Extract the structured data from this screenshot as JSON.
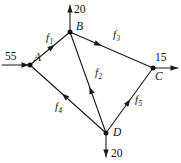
{
  "diagram": {
    "kind": "flow-network",
    "title": "",
    "colors": {
      "background": "#ffffff",
      "stroke": "#1a1a1a",
      "node_fill": "#111111",
      "text": "#111111"
    },
    "nodes": [
      {
        "id": "A",
        "label": "A",
        "x": 30,
        "y": 65,
        "label_x": 34,
        "label_y": 61
      },
      {
        "id": "B",
        "label": "B",
        "x": 70,
        "y": 32,
        "label_x": 76,
        "label_y": 30
      },
      {
        "id": "C",
        "label": "C",
        "x": 153,
        "y": 68,
        "label_x": 155,
        "label_y": 80
      },
      {
        "id": "D",
        "label": "D",
        "x": 106,
        "y": 133,
        "label_x": 113,
        "label_y": 136
      }
    ],
    "edges": [
      {
        "id": "f1",
        "label": "f",
        "subscript": "1",
        "from": "A",
        "to": "B",
        "label_x": 46,
        "label_y": 41,
        "arrow_t": 0.62
      },
      {
        "id": "f3",
        "label": "f",
        "subscript": "3",
        "from": "B",
        "to": "C",
        "label_x": 113,
        "label_y": 38,
        "arrow_t": 0.38
      },
      {
        "id": "f2",
        "label": "f",
        "subscript": "2",
        "from": "D",
        "to": "B",
        "label_x": 95,
        "label_y": 76,
        "arrow_t": 0.46
      },
      {
        "id": "f4",
        "label": "f",
        "subscript": "4",
        "from": "D",
        "to": "A",
        "label_x": 55,
        "label_y": 110,
        "arrow_t": 0.58
      },
      {
        "id": "f5",
        "label": "f",
        "subscript": "5",
        "from": "D",
        "to": "C",
        "label_x": 135,
        "label_y": 103,
        "arrow_t": 0.52
      }
    ],
    "external_flows": [
      {
        "id": "inflow-a",
        "value": "55",
        "node": "A",
        "direction": "into-node",
        "orientation": "horizontal-right",
        "line_x1": 2,
        "line_y1": 65,
        "line_x2": 29,
        "line_y2": 65,
        "label_x": 5,
        "label_y": 60
      },
      {
        "id": "outflow-b",
        "value": "20",
        "node": "B",
        "direction": "out-of-node",
        "orientation": "vertical-up",
        "line_x1": 70,
        "line_y1": 31,
        "line_x2": 70,
        "line_y2": 5,
        "label_x": 74,
        "label_y": 13
      },
      {
        "id": "outflow-c",
        "value": "15",
        "node": "C",
        "direction": "out-of-node",
        "orientation": "horizontal-right",
        "line_x1": 154,
        "line_y1": 68,
        "line_x2": 178,
        "line_y2": 68,
        "label_x": 155,
        "label_y": 61
      },
      {
        "id": "outflow-d",
        "value": "20",
        "node": "D",
        "direction": "out-of-node",
        "orientation": "vertical-down",
        "line_x1": 106,
        "line_y1": 134,
        "line_x2": 106,
        "line_y2": 157,
        "label_x": 111,
        "label_y": 157
      }
    ]
  }
}
